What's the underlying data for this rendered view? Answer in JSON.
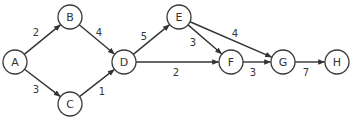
{
  "diagram": {
    "type": "weighted-directed-graph",
    "node_radius": 12,
    "colors": {
      "stroke": "#333333",
      "fill": "#ffffff",
      "text": "#333333"
    },
    "nodes": [
      {
        "id": "A",
        "label": "A",
        "x": 15,
        "y": 62
      },
      {
        "id": "B",
        "label": "B",
        "x": 70,
        "y": 17
      },
      {
        "id": "C",
        "label": "C",
        "x": 70,
        "y": 104
      },
      {
        "id": "D",
        "label": "D",
        "x": 124,
        "y": 62
      },
      {
        "id": "E",
        "label": "E",
        "x": 179,
        "y": 17
      },
      {
        "id": "F",
        "label": "F",
        "x": 231,
        "y": 62
      },
      {
        "id": "G",
        "label": "G",
        "x": 283,
        "y": 62
      },
      {
        "id": "H",
        "label": "H",
        "x": 337,
        "y": 62
      }
    ],
    "edges": [
      {
        "from": "A",
        "to": "B",
        "weight": "2",
        "lx": 36,
        "ly": 32
      },
      {
        "from": "A",
        "to": "C",
        "weight": "3",
        "lx": 36,
        "ly": 89
      },
      {
        "from": "B",
        "to": "D",
        "weight": "4",
        "lx": 99,
        "ly": 32
      },
      {
        "from": "C",
        "to": "D",
        "weight": "1",
        "lx": 102,
        "ly": 91
      },
      {
        "from": "D",
        "to": "E",
        "weight": "5",
        "lx": 144,
        "ly": 36
      },
      {
        "from": "D",
        "to": "F",
        "weight": "2",
        "lx": 176,
        "ly": 72
      },
      {
        "from": "E",
        "to": "F",
        "weight": "3",
        "lx": 193,
        "ly": 42
      },
      {
        "from": "E",
        "to": "G",
        "weight": "4",
        "lx": 235,
        "ly": 33
      },
      {
        "from": "F",
        "to": "G",
        "weight": "3",
        "lx": 253,
        "ly": 72
      },
      {
        "from": "G",
        "to": "H",
        "weight": "7",
        "lx": 306,
        "ly": 72
      }
    ]
  }
}
